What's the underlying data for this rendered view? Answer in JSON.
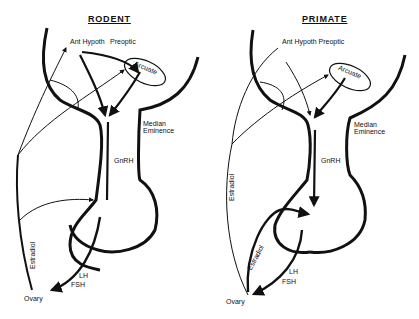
{
  "figure": {
    "panels": [
      {
        "id": "rodent",
        "title": "RODENT",
        "labels": {
          "ant_hypoth": "Ant Hypoth",
          "preoptic": "Preoptic",
          "arcuate": "Arcuate",
          "median_eminence_1": "Median",
          "median_eminence_2": "Eminence",
          "gnrh": "GnRH",
          "estradiol": "Estradiol",
          "lh": "LH",
          "fsh": "FSH",
          "ovary": "Ovary"
        }
      },
      {
        "id": "primate",
        "title": "PRIMATE",
        "labels": {
          "ant_hypoth_preoptic": "Ant Hypoth Preoptic",
          "arcuate": "Arcuate",
          "median_eminence_1": "Median",
          "median_eminence_2": "Eminence",
          "gnrh": "GnRH",
          "estradiol_outer": "Estradiol",
          "estradiol_inner": "Estradiol",
          "lh": "LH",
          "fsh": "FSH",
          "ovary": "Ovary"
        }
      }
    ],
    "colors": {
      "ink": "#111111",
      "background": "#ffffff"
    }
  }
}
